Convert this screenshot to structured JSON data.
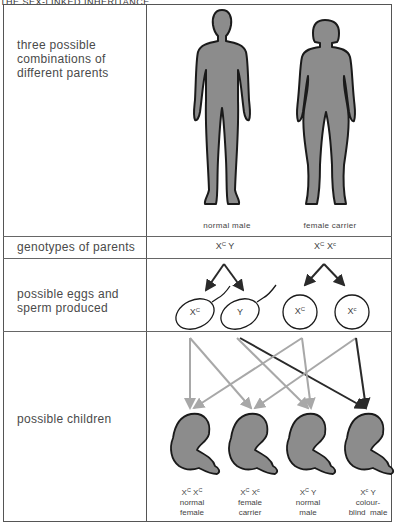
{
  "header": {
    "title": "THE SEX-LINKED INHERITANCE"
  },
  "rows": [
    {
      "label": "three possible combinations of different parents"
    },
    {
      "label": "genotypes of parents"
    },
    {
      "label": "possible eggs and sperm produced"
    },
    {
      "label": "possible children"
    }
  ],
  "parents": [
    {
      "caption": "normal male",
      "genotype_a": "X",
      "genotype_a_sup": "C",
      "genotype_b": "Y",
      "genotype_b_sup": ""
    },
    {
      "caption": "female carrier",
      "genotype_a": "X",
      "genotype_a_sup": "C",
      "genotype_b": "X",
      "genotype_b_sup": "c"
    }
  ],
  "gametes": [
    {
      "type": "sperm",
      "label": "X",
      "sup": "C"
    },
    {
      "type": "sperm",
      "label": "Y",
      "sup": ""
    },
    {
      "type": "egg",
      "label": "X",
      "sup": "C"
    },
    {
      "type": "egg",
      "label": "X",
      "sup": "c"
    }
  ],
  "children": [
    {
      "g1": "X",
      "g1sup": "C",
      "g2": "X",
      "g2sup": "C",
      "line1": "normal",
      "line2": "female"
    },
    {
      "g1": "X",
      "g1sup": "C",
      "g2": "X",
      "g2sup": "c",
      "line1": "female",
      "line2": "carrier"
    },
    {
      "g1": "X",
      "g1sup": "C",
      "g2": "Y",
      "g2sup": "",
      "line1": "normal",
      "line2": "male"
    },
    {
      "g1": "X",
      "g1sup": "c",
      "g2": "Y",
      "g2sup": "",
      "line1": "colour-",
      "line2": "blind  male"
    }
  ],
  "colors": {
    "figure_fill": "#8c8c8c",
    "outline": "#1a1a1a",
    "grey_arrow": "#a8a8a8",
    "dark_arrow": "#2a2a2a"
  }
}
